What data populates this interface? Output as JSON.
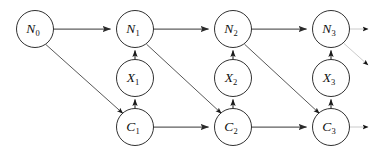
{
  "figure": {
    "type": "directed-graph-diagram",
    "title": "",
    "background_color": "#ffffff",
    "width": 387,
    "height": 155
  },
  "style": {
    "node_fill": "#ffffff",
    "node_stroke": "#1a1a1a",
    "horizontal_edge_color": "#5e5e5e",
    "vertical_edge_color": "#1a1a1a",
    "diagonal_edge_color": "#3a3a3a",
    "faded_edge_color": "#9a9a9a",
    "label_color": "#111111"
  },
  "rows": {
    "top": {
      "name": "N-row",
      "y": 29
    },
    "middle": {
      "name": "X-row",
      "y": 78
    },
    "bottom": {
      "name": "C-row",
      "y": 127
    }
  },
  "columns": [
    {
      "index": 0,
      "x": 35
    },
    {
      "index": 1,
      "x": 135
    },
    {
      "index": 2,
      "x": 233
    },
    {
      "index": 3,
      "x": 331
    }
  ],
  "nodes": [
    {
      "id": "N0",
      "base": "N",
      "sub": "0",
      "x": 35,
      "y": 29,
      "r": 18.5
    },
    {
      "id": "N1",
      "base": "N",
      "sub": "1",
      "x": 135,
      "y": 29,
      "r": 18.5
    },
    {
      "id": "N2",
      "base": "N",
      "sub": "2",
      "x": 233,
      "y": 29,
      "r": 18.5
    },
    {
      "id": "N3",
      "base": "N",
      "sub": "3",
      "x": 331,
      "y": 29,
      "r": 18.5
    },
    {
      "id": "X1",
      "base": "X",
      "sub": "1",
      "x": 135,
      "y": 78,
      "r": 18.5
    },
    {
      "id": "X2",
      "base": "X",
      "sub": "2",
      "x": 233,
      "y": 78,
      "r": 18.5
    },
    {
      "id": "X3",
      "base": "X",
      "sub": "3",
      "x": 331,
      "y": 78,
      "r": 18.5
    },
    {
      "id": "C1",
      "base": "C",
      "sub": "1",
      "x": 135,
      "y": 127,
      "r": 18.5
    },
    {
      "id": "C2",
      "base": "C",
      "sub": "2",
      "x": 233,
      "y": 127,
      "r": 18.5
    },
    {
      "id": "C3",
      "base": "C",
      "sub": "3",
      "x": 331,
      "y": 127,
      "r": 18.5
    }
  ],
  "edges": [
    {
      "id": "N0-N1",
      "from": "N0",
      "to": "N1",
      "kind": "horizontal"
    },
    {
      "id": "N1-N2",
      "from": "N1",
      "to": "N2",
      "kind": "horizontal"
    },
    {
      "id": "N2-N3",
      "from": "N2",
      "to": "N3",
      "kind": "horizontal"
    },
    {
      "id": "C1-C2",
      "from": "C1",
      "to": "C2",
      "kind": "horizontal"
    },
    {
      "id": "C2-C3",
      "from": "C2",
      "to": "C3",
      "kind": "horizontal"
    },
    {
      "id": "X1-N1",
      "from": "X1",
      "to": "N1",
      "kind": "vertical"
    },
    {
      "id": "X2-N2",
      "from": "X2",
      "to": "N2",
      "kind": "vertical"
    },
    {
      "id": "X3-N3",
      "from": "X3",
      "to": "N3",
      "kind": "vertical"
    },
    {
      "id": "C1-X1",
      "from": "C1",
      "to": "X1",
      "kind": "vertical"
    },
    {
      "id": "C2-X2",
      "from": "C2",
      "to": "X2",
      "kind": "vertical"
    },
    {
      "id": "C3-X3",
      "from": "C3",
      "to": "X3",
      "kind": "vertical"
    },
    {
      "id": "N0-C1",
      "from": "N0",
      "to": "C1",
      "kind": "diagonal"
    },
    {
      "id": "N1-C2",
      "from": "N1",
      "to": "C2",
      "kind": "diagonal"
    },
    {
      "id": "N2-C3",
      "from": "N2",
      "to": "C3",
      "kind": "diagonal"
    }
  ],
  "trailing_edges": [
    {
      "id": "N3-out",
      "from": "N3",
      "kind": "horizontal-faded"
    },
    {
      "id": "N3-diag",
      "from": "N3",
      "kind": "diagonal-faded"
    },
    {
      "id": "C3-out",
      "from": "C3",
      "kind": "horizontal-faded"
    }
  ]
}
